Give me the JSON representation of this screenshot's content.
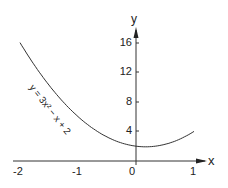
{
  "chart_data": {
    "type": "line",
    "title": "",
    "xlabel": "x",
    "ylabel": "y",
    "xlim": [
      -2,
      1
    ],
    "ylim": [
      0,
      16
    ],
    "grid": false,
    "x_ticks": [
      "-2",
      "-1",
      "0",
      "1"
    ],
    "y_ticks": [
      "4",
      "8",
      "12",
      "16"
    ],
    "series": [
      {
        "name": "y = 3x² − x + 2",
        "x": [
          -2,
          -1.5,
          -1,
          -0.5,
          0,
          0.1667,
          0.5,
          1
        ],
        "values": [
          16,
          10.25,
          6,
          3.25,
          2,
          1.92,
          2.25,
          4
        ]
      }
    ],
    "annotations": [
      "y = 3x² − x + 2"
    ]
  },
  "labels": {
    "x_axis": "x",
    "y_axis": "y",
    "x_ticks": [
      "-2",
      "-1",
      "0",
      "1"
    ],
    "y_ticks": [
      "16",
      "12",
      "8",
      "4"
    ],
    "curve": "y = 3x² − x + 2"
  }
}
